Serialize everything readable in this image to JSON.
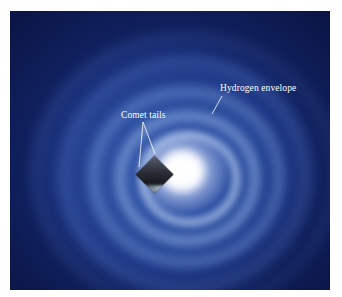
{
  "figure": {
    "labels": {
      "comet_tails": "Comet tails",
      "hydrogen_envelope": "Hydrogen envelope"
    },
    "colors": {
      "background_dark": "#122466",
      "envelope_mid": "#3356a8",
      "core": "#ffffff",
      "label_text": "#ffffff"
    }
  }
}
